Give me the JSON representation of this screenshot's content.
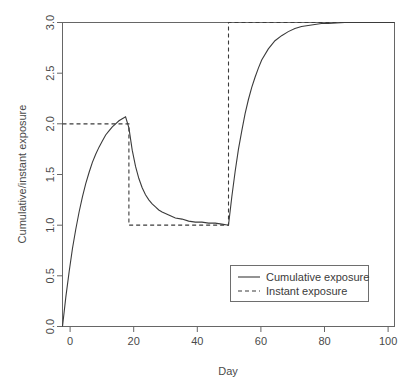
{
  "chart_data": {
    "type": "line",
    "title": "",
    "xlabel": "Day",
    "ylabel": "Cumulative/instant exposure",
    "xlim": [
      0,
      100
    ],
    "ylim": [
      0.0,
      3.0
    ],
    "xticks": [
      0,
      20,
      40,
      60,
      80,
      100
    ],
    "xtick_labels": [
      "0",
      "20",
      "40",
      "60",
      "80",
      "100"
    ],
    "yticks": [
      0.0,
      0.5,
      1.0,
      1.5,
      2.0,
      2.5,
      3.0
    ],
    "ytick_labels": [
      "0.0",
      "0.5",
      "1.0",
      "1.5",
      "2.0",
      "2.5",
      "3.0"
    ],
    "grid": false,
    "legend_position": "center-right-lower",
    "series": [
      {
        "name": "Cumulative exposure",
        "style": "solid",
        "color": "#3b3b3b",
        "x": [
          0,
          1,
          2,
          3,
          4,
          5,
          6,
          7,
          8,
          9,
          10,
          11,
          12,
          13,
          14,
          15,
          16,
          17,
          18,
          19,
          20,
          21,
          22,
          23,
          24,
          25,
          26,
          27,
          28,
          29,
          30,
          32,
          34,
          36,
          38,
          40,
          42,
          44,
          46,
          48,
          50,
          51,
          52,
          53,
          54,
          55,
          56,
          57,
          58,
          59,
          60,
          62,
          64,
          66,
          68,
          70,
          72,
          74,
          76,
          78,
          80,
          85,
          90,
          95,
          100
        ],
        "y": [
          0.0,
          0.29,
          0.54,
          0.77,
          0.96,
          1.13,
          1.28,
          1.41,
          1.52,
          1.62,
          1.7,
          1.77,
          1.83,
          1.89,
          1.93,
          1.97,
          2.0,
          2.03,
          2.05,
          2.07,
          1.96,
          1.74,
          1.58,
          1.46,
          1.37,
          1.3,
          1.25,
          1.21,
          1.18,
          1.15,
          1.13,
          1.1,
          1.07,
          1.06,
          1.04,
          1.03,
          1.03,
          1.02,
          1.02,
          1.01,
          1.0,
          1.28,
          1.53,
          1.75,
          1.93,
          2.1,
          2.24,
          2.36,
          2.46,
          2.55,
          2.63,
          2.74,
          2.82,
          2.87,
          2.91,
          2.94,
          2.96,
          2.97,
          2.98,
          2.99,
          2.99,
          3.0,
          3.0,
          3.0,
          3.0
        ]
      },
      {
        "name": "Instant exposure",
        "style": "dashed",
        "color": "#3b3b3b",
        "steps": [
          {
            "x_start": 0,
            "x_end": 20,
            "value": 2.0
          },
          {
            "x_start": 20,
            "x_end": 50,
            "value": 1.0
          },
          {
            "x_start": 50,
            "x_end": 100,
            "value": 3.0
          }
        ],
        "x": [
          0,
          20,
          20,
          50,
          50,
          100
        ],
        "y": [
          2.0,
          2.0,
          1.0,
          1.0,
          3.0,
          3.0
        ]
      }
    ],
    "annotations": []
  },
  "legend": {
    "entries": [
      {
        "label": "Cumulative exposure",
        "style": "solid"
      },
      {
        "label": "Instant exposure",
        "style": "dashed"
      }
    ]
  },
  "colors": {
    "background": "#ffffff",
    "axis": "#666666",
    "line": "#3b3b3b",
    "text": "#4a4a4a"
  }
}
